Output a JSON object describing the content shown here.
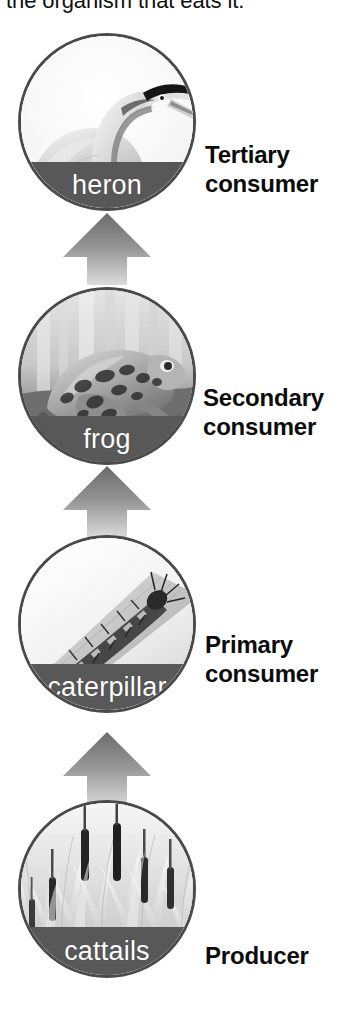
{
  "caption": {
    "text": "the organism that eats it."
  },
  "colors": {
    "band": "#585858",
    "circle_border": "#4a4a4a",
    "arrow_dark": "#6b6b6b",
    "arrow_light": "#d6d6d6",
    "text": "#0c0c0c",
    "band_text": "#ffffff",
    "background": "#ffffff"
  },
  "diagram": {
    "type": "food-chain",
    "direction": "bottom-to-top",
    "levels": [
      {
        "id": "tertiary",
        "organism": "heron",
        "tier_label_line1": "Tertiary",
        "tier_label_line2": "consumer",
        "art": "heron-illustration"
      },
      {
        "id": "secondary",
        "organism": "frog",
        "tier_label_line1": "Secondary",
        "tier_label_line2": "consumer",
        "art": "frog-photo"
      },
      {
        "id": "primary",
        "organism": "caterpillar",
        "tier_label_line1": "Primary",
        "tier_label_line2": "consumer",
        "art": "caterpillar-photo"
      },
      {
        "id": "producer",
        "organism": "cattails",
        "tier_label_line1": "Producer",
        "tier_label_line2": "",
        "art": "cattails-photo"
      }
    ],
    "arrows": [
      {
        "id": "arrow-cattails-to-caterpillar",
        "from": "cattails",
        "to": "caterpillar"
      },
      {
        "id": "arrow-caterpillar-to-frog",
        "from": "caterpillar",
        "to": "frog"
      },
      {
        "id": "arrow-frog-to-heron",
        "from": "frog",
        "to": "heron"
      }
    ]
  }
}
